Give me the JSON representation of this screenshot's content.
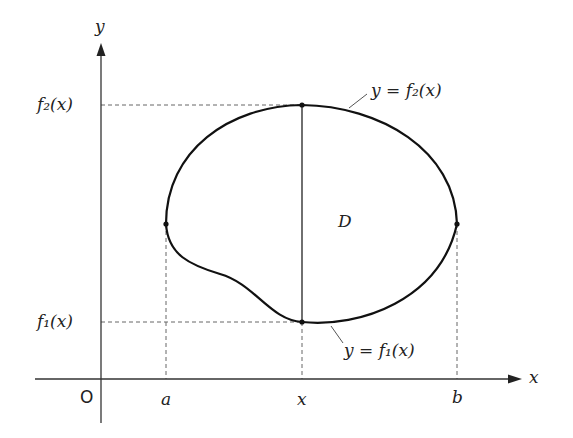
{
  "figure": {
    "type": "region-of-integration",
    "region_label": "D",
    "axes": {
      "x_label": "x",
      "y_label": "y",
      "origin_label": "O"
    },
    "x_ticks": [
      {
        "label": "a"
      },
      {
        "label": "x"
      },
      {
        "label": "b"
      }
    ],
    "y_ticks": [
      {
        "label": "f₂(x)"
      },
      {
        "label": "f₁(x)"
      }
    ],
    "curves": [
      {
        "name": "upper",
        "label": "y = f₂(x)"
      },
      {
        "name": "lower",
        "label": "y = f₁(x)"
      }
    ],
    "colors": {
      "curve": "#111111",
      "axis": "#333333",
      "dashed": "#666666",
      "background": "#ffffff"
    }
  }
}
